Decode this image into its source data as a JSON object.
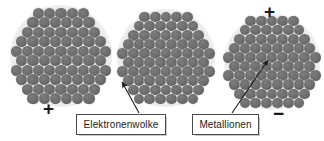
{
  "diagram": {
    "language": "de",
    "colors": {
      "ion_fill": "#6e6e6e",
      "electron_cloud": "#e9e9e9",
      "background": "#ffffff",
      "text": "#1b1b1b",
      "box_border": "#4a4a4a",
      "arrow": "#1b1b1b"
    },
    "clusters": [
      {
        "id": "cluster-left",
        "cx": 61,
        "cy": 56,
        "halo_r": 51,
        "ion_radius": 5.6,
        "rows": [
          5,
          6,
          7,
          8,
          9,
          8,
          9,
          8,
          7,
          6
        ],
        "shape": "hexagonal-close-packed"
      },
      {
        "id": "cluster-middle",
        "cx": 166,
        "cy": 58,
        "halo_r": 49,
        "ion_radius": 5.4,
        "rows": [
          5,
          6,
          7,
          8,
          9,
          8,
          9,
          8,
          7,
          6
        ],
        "shape": "hexagonal-close-packed"
      },
      {
        "id": "cluster-right",
        "cx": 272,
        "cy": 62,
        "halo_r": 48,
        "ion_radius": 5.4,
        "rows": [
          5,
          6,
          7,
          8,
          9,
          8,
          9,
          8,
          7,
          6
        ],
        "shape": "hexagonal-close-packed"
      }
    ],
    "charges": [
      {
        "id": "charge-left-plus",
        "symbol": "+",
        "x": 43,
        "y": 99,
        "size": 19
      },
      {
        "id": "charge-right-plus",
        "symbol": "+",
        "x": 264,
        "y": 2,
        "size": 19
      },
      {
        "id": "charge-right-minus",
        "symbol": "−",
        "x": 273,
        "y": 104,
        "size": 19
      }
    ],
    "labels": [
      {
        "id": "label-elektronenwolke",
        "text": "Elektronenwolke",
        "x": 76,
        "y": 114,
        "w": 88,
        "h": 19,
        "arrow": {
          "x1": 139,
          "y1": 113,
          "x2": 122,
          "y2": 82
        }
      },
      {
        "id": "label-metallionen",
        "text": "Metallionen",
        "x": 192,
        "y": 114,
        "w": 65,
        "h": 19,
        "arrow": {
          "x1": 232,
          "y1": 113,
          "x2": 268,
          "y2": 60
        }
      }
    ]
  }
}
